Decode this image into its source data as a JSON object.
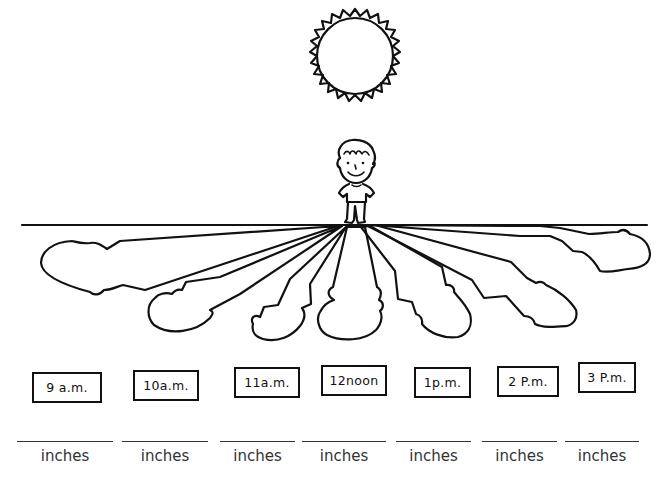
{
  "worksheet": {
    "illustration": {
      "sun": "sun-icon",
      "child": "boy-figure",
      "ground": "horizon-line",
      "shadows_count": 7
    },
    "times": [
      {
        "label": "9 a.m."
      },
      {
        "label": "10a.m."
      },
      {
        "label": "11a.m."
      },
      {
        "label": "12noon"
      },
      {
        "label": "1p.m."
      },
      {
        "label": "2 P.m."
      },
      {
        "label": "3 P.m."
      }
    ],
    "answers": [
      {
        "value": "",
        "unit": "inches"
      },
      {
        "value": "",
        "unit": "inches"
      },
      {
        "value": "",
        "unit": "inches"
      },
      {
        "value": "",
        "unit": "inches"
      },
      {
        "value": "",
        "unit": "inches"
      },
      {
        "value": "",
        "unit": "inches"
      },
      {
        "value": "",
        "unit": "inches"
      }
    ],
    "colors": {
      "ink": "#111111",
      "text": "#333333",
      "background": "#ffffff"
    }
  }
}
